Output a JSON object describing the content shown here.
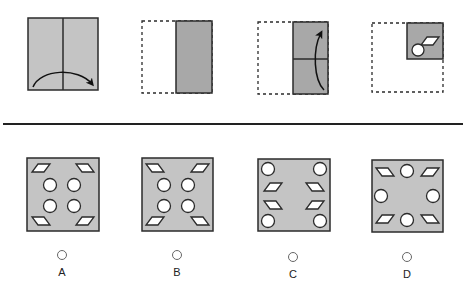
{
  "colors": {
    "paper": "#c4c4c4",
    "folded": "#a8a8a8",
    "stroke": "#2b2b2b",
    "hole": "#ffffff",
    "separator": "#222222"
  },
  "question": {
    "steps": [
      {
        "step": 1,
        "description": "Full square with vertical center crease; curved arrow folds left half over to the right"
      },
      {
        "step": 2,
        "description": "Left half shown as dashed outline; folded right half shaded darker"
      },
      {
        "step": 3,
        "description": "Folded strip with horizontal crease; curved arrow folds bottom half up"
      },
      {
        "step": 4,
        "description": "Quarter-size folded square at top-right with a punched parallelogram and a circle"
      }
    ]
  },
  "options": [
    {
      "label": "A",
      "description": "Parallelograms at four corners (TL /, TR \\, BL \\, BR /), four circles in 2x2 center grid"
    },
    {
      "label": "B",
      "description": "Parallelograms at four corners (TL \\, TR /, BL /, BR \\), four circles in 2x2 center grid"
    },
    {
      "label": "C",
      "description": "Circles at four corners, parallelograms on left and right sides in the middle"
    },
    {
      "label": "D",
      "description": "Parallelograms at four corners, circles at top, bottom, left and right midpoints"
    }
  ]
}
